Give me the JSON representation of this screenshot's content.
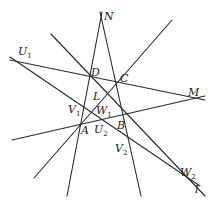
{
  "diagram": {
    "type": "projective-geometry-figure",
    "stroke_color": "#2a2a2a",
    "background": "#ffffff",
    "lines": [
      {
        "id": "line-ND",
        "name": "line through N, D, A",
        "x1": 102,
        "y1": 12,
        "x2": 67,
        "y2": 196
      },
      {
        "id": "line-NB",
        "name": "line through N, C, B",
        "x1": 100,
        "y1": 12,
        "x2": 141,
        "y2": 196
      },
      {
        "id": "line-DC",
        "name": "line through U1, D, C, M",
        "x1": 10,
        "y1": 60,
        "x2": 205,
        "y2": 100
      },
      {
        "id": "line-AB",
        "name": "line through A, U2, B, M",
        "x1": 12,
        "y1": 140,
        "x2": 205,
        "y2": 96
      },
      {
        "id": "line-DB",
        "name": "diagonal through D, L, W1, B, W2",
        "x1": 51,
        "y1": 34,
        "x2": 205,
        "y2": 196
      },
      {
        "id": "line-AC",
        "name": "diagonal through C, L, A",
        "x1": 172,
        "y1": 20,
        "x2": 34,
        "y2": 178
      },
      {
        "id": "line-l",
        "name": "line l through U1, V1, W1, V2, W2",
        "x1": 10,
        "y1": 57,
        "x2": 200,
        "y2": 186
      }
    ],
    "labels": [
      {
        "id": "N",
        "text": "N",
        "sub": "",
        "x": 104,
        "y": 20
      },
      {
        "id": "U1",
        "text": "U",
        "sub": "1",
        "x": 18,
        "y": 55
      },
      {
        "id": "D",
        "text": "D",
        "sub": "",
        "x": 91,
        "y": 76
      },
      {
        "id": "C",
        "text": "C",
        "sub": "",
        "x": 120,
        "y": 82
      },
      {
        "id": "M",
        "text": "M",
        "sub": "",
        "x": 188,
        "y": 96
      },
      {
        "id": "L",
        "text": "L",
        "sub": "",
        "x": 93,
        "y": 100
      },
      {
        "id": "V1",
        "text": "V",
        "sub": "1",
        "x": 68,
        "y": 113
      },
      {
        "id": "W1",
        "text": "W",
        "sub": "1",
        "x": 96,
        "y": 114
      },
      {
        "id": "A",
        "text": "A",
        "sub": "",
        "x": 81,
        "y": 134
      },
      {
        "id": "U2",
        "text": "U",
        "sub": "2",
        "x": 94,
        "y": 133
      },
      {
        "id": "B",
        "text": "B",
        "sub": "",
        "x": 117,
        "y": 129
      },
      {
        "id": "V2",
        "text": "V",
        "sub": "2",
        "x": 115,
        "y": 152
      },
      {
        "id": "W2",
        "text": "W",
        "sub": "2",
        "x": 180,
        "y": 176
      },
      {
        "id": "l",
        "text": "l",
        "sub": "",
        "x": 195,
        "y": 193
      }
    ]
  }
}
